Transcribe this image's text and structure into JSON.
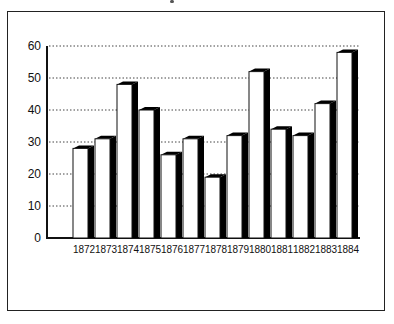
{
  "chart_data": {
    "type": "bar",
    "style": "3d-bar",
    "title": "",
    "xlabel": "",
    "ylabel": "",
    "categories": [
      "1872",
      "1873",
      "1874",
      "1875",
      "1876",
      "1877",
      "1878",
      "1879",
      "1880",
      "1881",
      "1882",
      "1883",
      "1884"
    ],
    "values": [
      28,
      31,
      48,
      40,
      26,
      31,
      19,
      32,
      52,
      34,
      32,
      42,
      58
    ],
    "ylim": [
      0,
      60
    ],
    "yticks": [
      0,
      10,
      20,
      30,
      40,
      50,
      60
    ],
    "grid": "horizontal dotted",
    "legend": "none",
    "colors": {
      "bar_face": "#ffffff",
      "bar_side": "#000000",
      "outline": "#111111",
      "grid": "#444444"
    }
  }
}
